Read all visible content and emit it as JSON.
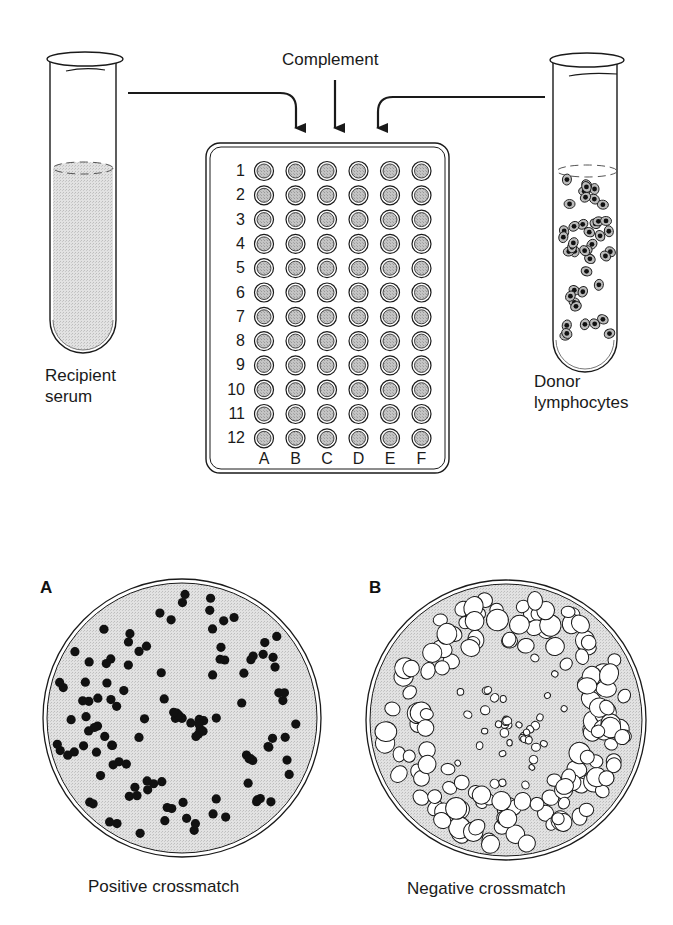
{
  "figure": {
    "labels": {
      "complement": "Complement",
      "recipient_line1": "Recipient",
      "recipient_line2": "serum",
      "donor_line1": "Donor",
      "donor_line2": "lymphocytes"
    },
    "plate": {
      "rows": [
        "1",
        "2",
        "3",
        "4",
        "5",
        "6",
        "7",
        "8",
        "9",
        "10",
        "11",
        "12"
      ],
      "columns": [
        "A",
        "B",
        "C",
        "D",
        "E",
        "F"
      ]
    },
    "panels": [
      {
        "letter": "A",
        "caption": "Positive crossmatch",
        "cell_state": "dead-cells-dark"
      },
      {
        "letter": "B",
        "caption": "Negative crossmatch",
        "cell_state": "live-cells-clear"
      }
    ],
    "colors": {
      "ink": "#1a1a1a",
      "fill_gray": "#d9d9d9",
      "well_fill": "#bdbdbd",
      "background": "#ffffff"
    }
  }
}
